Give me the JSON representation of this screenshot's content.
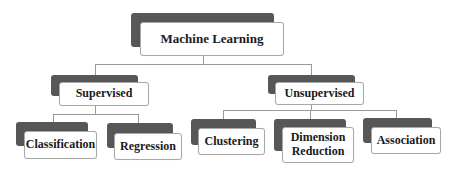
{
  "diagram": {
    "title": "Machine Learning",
    "root": {
      "label": "Machine Learning",
      "children": [
        {
          "label": "Supervised",
          "children": [
            {
              "label": "Classification"
            },
            {
              "label": "Regression"
            }
          ]
        },
        {
          "label": "Unsupervised",
          "children": [
            {
              "label": "Clustering"
            },
            {
              "label": "Dimension Reduction"
            },
            {
              "label": "Association"
            }
          ]
        }
      ]
    }
  },
  "colors": {
    "shadow": "#575757",
    "card_bg": "#ffffff",
    "card_border": "#a8a8a8",
    "connector": "#9a9a9a",
    "text": "#1a1a1a"
  }
}
